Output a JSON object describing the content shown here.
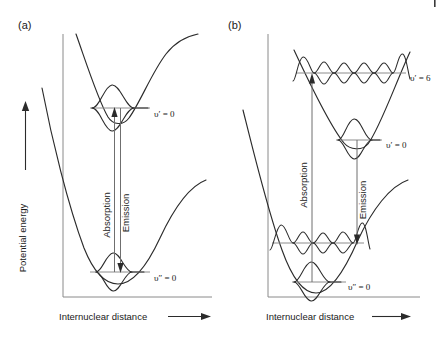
{
  "figure": {
    "type": "diagram",
    "background_color": "#ffffff",
    "curve_color": "#2b2b2b",
    "level_color": "#8c8c8c",
    "arrow_color": "#6f6f6f"
  },
  "panels": [
    {
      "tag": "(a)",
      "y_axis_label": "Potential energy",
      "x_axis_label": "Internuclear distance",
      "transitions": [
        {
          "name": "absorption",
          "label": "Absorption",
          "direction": "up"
        },
        {
          "name": "emission",
          "label": "Emission",
          "direction": "down"
        }
      ],
      "levels": [
        {
          "name": "upper-state",
          "label": "υ′ = 0",
          "quantum_number": 0,
          "state": "excited"
        },
        {
          "name": "lower-state",
          "label": "υ″ = 0",
          "quantum_number": 0,
          "state": "ground"
        }
      ]
    },
    {
      "tag": "(b)",
      "y_axis_label": "",
      "x_axis_label": "Internuclear distance",
      "transitions": [
        {
          "name": "absorption",
          "label": "Absorption",
          "direction": "up"
        },
        {
          "name": "emission",
          "label": "Emission",
          "direction": "down"
        }
      ],
      "levels": [
        {
          "name": "upper-state-v6",
          "label": "υ′ = 6",
          "quantum_number": 6,
          "state": "excited"
        },
        {
          "name": "upper-state-v0",
          "label": "υ′ = 0",
          "quantum_number": 0,
          "state": "excited"
        },
        {
          "name": "lower-state-v0",
          "label": "υ″ = 0",
          "quantum_number": 0,
          "state": "ground"
        }
      ]
    }
  ]
}
